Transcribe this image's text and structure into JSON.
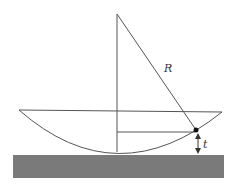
{
  "diagram": {
    "type": "physics-geometry",
    "labels": {
      "radius": "R",
      "gap": "t"
    },
    "colors": {
      "line": "#555555",
      "ground": "#7a7a7a",
      "point": "#111111",
      "background": "#ffffff"
    },
    "geometry": {
      "apex": [
        117,
        14
      ],
      "rim_left": [
        19,
        110
      ],
      "rim_right": [
        222,
        112
      ],
      "bottom": [
        117,
        152
      ],
      "contact_point": [
        196,
        130
      ],
      "inner_horizontal_y": 132,
      "ground_rect": {
        "x": 13,
        "y": 155,
        "width": 211,
        "height": 23
      }
    }
  }
}
